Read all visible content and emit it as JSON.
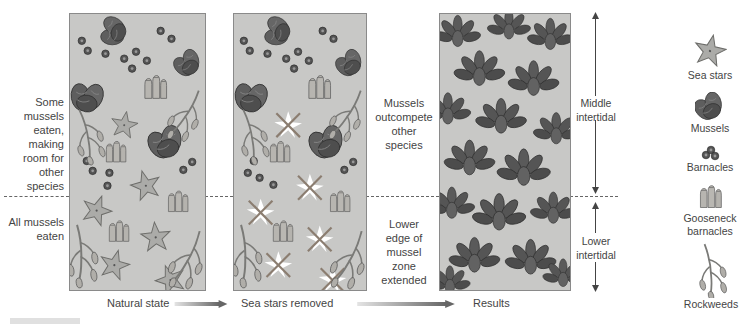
{
  "figure": {
    "label_partial": "FIGURE"
  },
  "panels": [
    {
      "id": "natural",
      "caption": "Natural state"
    },
    {
      "id": "removed",
      "caption": "Sea stars removed"
    },
    {
      "id": "results",
      "caption": "Results"
    }
  ],
  "left_labels": {
    "upper": [
      "Some",
      "mussels",
      "eaten,",
      "making",
      "room for",
      "other",
      "species"
    ],
    "lower": [
      "All mussels",
      "eaten"
    ]
  },
  "middle_labels": {
    "upper": [
      "Mussels",
      "outcompete",
      "other",
      "species"
    ],
    "lower": [
      "Lower",
      "edge of",
      "mussel",
      "zone",
      "extended"
    ]
  },
  "zone_labels": {
    "middle": [
      "Middle",
      "intertidal"
    ],
    "lower": [
      "Lower",
      "intertidal"
    ]
  },
  "legend": [
    {
      "icon": "sea-star-icon",
      "label": "Sea stars"
    },
    {
      "icon": "mussel-icon",
      "label": "Mussels"
    },
    {
      "icon": "barnacle-icon",
      "label": "Barnacles"
    },
    {
      "icon": "gooseneck-barnacle-icon",
      "label": "Gooseneck barnacles"
    },
    {
      "icon": "rockweed-icon",
      "label": "Rockweeds"
    }
  ],
  "colors": {
    "panel_bg": "#c8c8c6",
    "panel_border": "#8a8a8a",
    "mussel": "#5a5a5a",
    "sea_star": "#a9a9a6",
    "removed_mark": "#ffffff",
    "arrow_gradient_start": "#dedede",
    "arrow_gradient_end": "#6a6a6a",
    "text": "#444444"
  }
}
